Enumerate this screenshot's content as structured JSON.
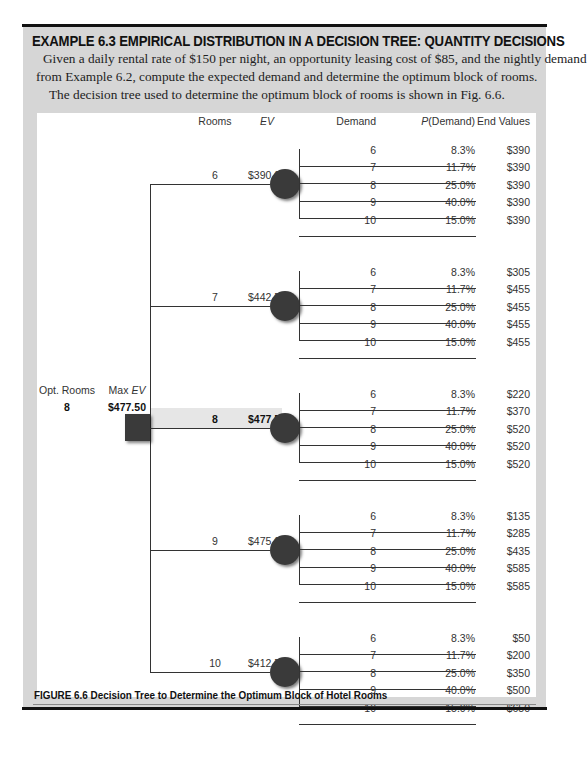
{
  "example": {
    "title": "EXAMPLE 6.3 EMPIRICAL DISTRIBUTION IN A DECISION TREE: QUANTITY DECISIONS",
    "paragraph_lines": [
      "Given a daily rental rate of $150 per night, an opportunity leasing cost of $85, and the nightly demand",
      "from Example 6.2, compute the expected demand and determine the optimum block of rooms.",
      "The decision tree used to determine the optimum block of rooms is shown in Fig. 6.6."
    ]
  },
  "figure": {
    "caption": "FIGURE 6.6  Decision Tree to Determine the Optimum Block of Hotel Rooms",
    "headers": {
      "rooms": "Rooms",
      "ev": "EV",
      "demand": "Demand",
      "p_demand_italic": "P",
      "p_demand_rest": "(Demand)",
      "end_values": "End Values"
    },
    "decision": {
      "opt_rooms_label": "Opt. Rooms",
      "max_ev_label_prefix": "Max ",
      "max_ev_label_italic": "EV",
      "opt_rooms_value": "8",
      "max_ev_value": "$477.50"
    },
    "branches": [
      {
        "rooms": "6",
        "ev": "$390.00",
        "highlighted": false,
        "outcomes": [
          {
            "demand": "6",
            "p": "8.3%",
            "end": "$390"
          },
          {
            "demand": "7",
            "p": "11.7%",
            "end": "$390"
          },
          {
            "demand": "8",
            "p": "25.0%",
            "end": "$390"
          },
          {
            "demand": "9",
            "p": "40.0%",
            "end": "$390"
          },
          {
            "demand": "10",
            "p": "15.0%",
            "end": "$390"
          }
        ]
      },
      {
        "rooms": "7",
        "ev": "$442.50",
        "highlighted": false,
        "outcomes": [
          {
            "demand": "6",
            "p": "8.3%",
            "end": "$305"
          },
          {
            "demand": "7",
            "p": "11.7%",
            "end": "$455"
          },
          {
            "demand": "8",
            "p": "25.0%",
            "end": "$455"
          },
          {
            "demand": "9",
            "p": "40.0%",
            "end": "$455"
          },
          {
            "demand": "10",
            "p": "15.0%",
            "end": "$455"
          }
        ]
      },
      {
        "rooms": "8",
        "ev": "$477.50",
        "highlighted": true,
        "outcomes": [
          {
            "demand": "6",
            "p": "8.3%",
            "end": "$220"
          },
          {
            "demand": "7",
            "p": "11.7%",
            "end": "$370"
          },
          {
            "demand": "8",
            "p": "25.0%",
            "end": "$520"
          },
          {
            "demand": "9",
            "p": "40.0%",
            "end": "$520"
          },
          {
            "demand": "10",
            "p": "15.0%",
            "end": "$520"
          }
        ]
      },
      {
        "rooms": "9",
        "ev": "$475.00",
        "highlighted": false,
        "outcomes": [
          {
            "demand": "6",
            "p": "8.3%",
            "end": "$135"
          },
          {
            "demand": "7",
            "p": "11.7%",
            "end": "$285"
          },
          {
            "demand": "8",
            "p": "25.0%",
            "end": "$435"
          },
          {
            "demand": "9",
            "p": "40.0%",
            "end": "$585"
          },
          {
            "demand": "10",
            "p": "15.0%",
            "end": "$585"
          }
        ]
      },
      {
        "rooms": "10",
        "ev": "$412.50",
        "highlighted": false,
        "outcomes": [
          {
            "demand": "6",
            "p": "8.3%",
            "end": "$50"
          },
          {
            "demand": "7",
            "p": "11.7%",
            "end": "$200"
          },
          {
            "demand": "8",
            "p": "25.0%",
            "end": "$350"
          },
          {
            "demand": "9",
            "p": "40.0%",
            "end": "$500"
          },
          {
            "demand": "10",
            "p": "15.0%",
            "end": "$650"
          }
        ]
      }
    ],
    "colors": {
      "node_fill": "#3a3a3a",
      "panel_gray": "#d6d6d6",
      "highlight_band": "#e6e6e6"
    }
  }
}
